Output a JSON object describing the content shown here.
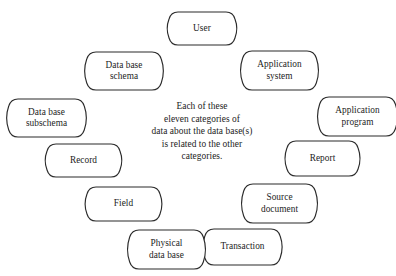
{
  "diagram": {
    "type": "circular-concept-diagram",
    "background_color": "#ffffff",
    "stroke_color": "#2b2b2b",
    "text_color": "#1c1c1c",
    "center_text": {
      "lines": [
        "Each of these",
        "eleven categories of",
        "data about the data base(s)",
        "is related to the other",
        "categories."
      ],
      "full_text": "Each of these eleven categories of data about the data base(s) is related to the other categories."
    },
    "node_count": 11,
    "nodes": [
      {
        "id": "user",
        "lines": [
          "User"
        ],
        "x": 171,
        "y": 12,
        "w": 62,
        "h": 33
      },
      {
        "id": "application-system",
        "lines": [
          "Application",
          "system"
        ],
        "x": 245,
        "y": 51,
        "w": 69,
        "h": 39
      },
      {
        "id": "application-program",
        "lines": [
          "Application",
          "program"
        ],
        "x": 322,
        "y": 97,
        "w": 71,
        "h": 39
      },
      {
        "id": "report",
        "lines": [
          "Report"
        ],
        "x": 289,
        "y": 141,
        "w": 67,
        "h": 35
      },
      {
        "id": "source-document",
        "lines": [
          "Source",
          "document"
        ],
        "x": 246,
        "y": 184,
        "w": 67,
        "h": 39
      },
      {
        "id": "transaction",
        "lines": [
          "Transaction"
        ],
        "x": 207,
        "y": 229,
        "w": 71,
        "h": 36
      },
      {
        "id": "physical-data-base",
        "lines": [
          "Physical",
          "data base"
        ],
        "x": 132,
        "y": 230,
        "w": 69,
        "h": 39
      },
      {
        "id": "field",
        "lines": [
          "Field"
        ],
        "x": 89,
        "y": 187,
        "w": 69,
        "h": 34
      },
      {
        "id": "record",
        "lines": [
          "Record"
        ],
        "x": 49,
        "y": 144,
        "w": 69,
        "h": 33
      },
      {
        "id": "data-base-subschema",
        "lines": [
          "Data base",
          "subschema"
        ],
        "x": 11,
        "y": 99,
        "w": 71,
        "h": 38
      },
      {
        "id": "data-base-schema",
        "lines": [
          "Data base",
          "schema"
        ],
        "x": 89,
        "y": 52,
        "w": 70,
        "h": 38
      }
    ]
  }
}
